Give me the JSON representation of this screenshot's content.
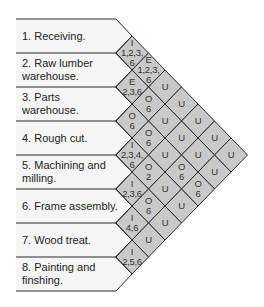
{
  "colors": {
    "row_fill": "#f5f5f5",
    "cell_fill": "#c9c9c9",
    "line": "#2a2a2a"
  },
  "departments": [
    {
      "number": 1,
      "label": "1. Receiving."
    },
    {
      "number": 2,
      "label": "2. Raw lumber warehouse."
    },
    {
      "number": 3,
      "label": "3. Parts warehouse."
    },
    {
      "number": 4,
      "label": "4. Rough cut."
    },
    {
      "number": 5,
      "label": "5. Machining and milling."
    },
    {
      "number": 6,
      "label": "6. Frame assembly."
    },
    {
      "number": 7,
      "label": "7. Wood treat."
    },
    {
      "number": 8,
      "label": "8. Painting and finshing."
    }
  ],
  "relationships": [
    {
      "from": 1,
      "to": 2,
      "code": "I",
      "reasons": "1,2,3,6"
    },
    {
      "from": 1,
      "to": 3,
      "code": "E",
      "reasons": "1,2,3,6"
    },
    {
      "from": 1,
      "to": 4,
      "code": "U",
      "reasons": ""
    },
    {
      "from": 1,
      "to": 5,
      "code": "U",
      "reasons": ""
    },
    {
      "from": 1,
      "to": 6,
      "code": "U",
      "reasons": ""
    },
    {
      "from": 1,
      "to": 7,
      "code": "U",
      "reasons": ""
    },
    {
      "from": 1,
      "to": 8,
      "code": "U",
      "reasons": ""
    },
    {
      "from": 2,
      "to": 3,
      "code": "E",
      "reasons": "2,3,6"
    },
    {
      "from": 2,
      "to": 4,
      "code": "O",
      "reasons": "6"
    },
    {
      "from": 2,
      "to": 5,
      "code": "U",
      "reasons": ""
    },
    {
      "from": 2,
      "to": 6,
      "code": "U",
      "reasons": ""
    },
    {
      "from": 2,
      "to": 7,
      "code": "U",
      "reasons": ""
    },
    {
      "from": 2,
      "to": 8,
      "code": "U",
      "reasons": ""
    },
    {
      "from": 3,
      "to": 4,
      "code": "O",
      "reasons": "6"
    },
    {
      "from": 3,
      "to": 5,
      "code": "O",
      "reasons": "6"
    },
    {
      "from": 3,
      "to": 6,
      "code": "U",
      "reasons": ""
    },
    {
      "from": 3,
      "to": 7,
      "code": "O",
      "reasons": "6"
    },
    {
      "from": 3,
      "to": 8,
      "code": "O",
      "reasons": "6"
    },
    {
      "from": 4,
      "to": 5,
      "code": "I",
      "reasons": "2,3,4,6"
    },
    {
      "from": 4,
      "to": 6,
      "code": "O",
      "reasons": "2"
    },
    {
      "from": 4,
      "to": 7,
      "code": "U",
      "reasons": ""
    },
    {
      "from": 4,
      "to": 8,
      "code": "U",
      "reasons": ""
    },
    {
      "from": 5,
      "to": 6,
      "code": "I",
      "reasons": "2,3,6"
    },
    {
      "from": 5,
      "to": 7,
      "code": "O",
      "reasons": "6"
    },
    {
      "from": 5,
      "to": 8,
      "code": "U",
      "reasons": ""
    },
    {
      "from": 6,
      "to": 7,
      "code": "I",
      "reasons": "4,6"
    },
    {
      "from": 6,
      "to": 8,
      "code": "U",
      "reasons": ""
    },
    {
      "from": 7,
      "to": 8,
      "code": "I",
      "reasons": "2,5,6"
    }
  ]
}
